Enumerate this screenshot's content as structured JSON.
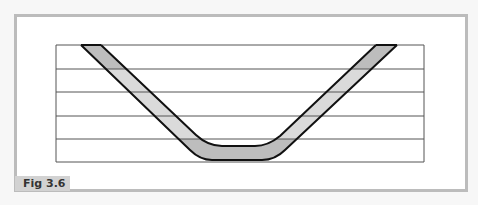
{
  "figure": {
    "label": "Fig 3.6",
    "type": "cross-section diagram"
  },
  "diagram": {
    "grid": {
      "rows": 5,
      "line_color": "#555555"
    },
    "band": {
      "outline_color": "#111111",
      "fill_dark": "#bdbdbd",
      "fill_light": "#dadada"
    },
    "frame": {
      "border_color": "#bcbcbc",
      "background": "#ffffff"
    },
    "label_bg": "#d2d2d2"
  }
}
